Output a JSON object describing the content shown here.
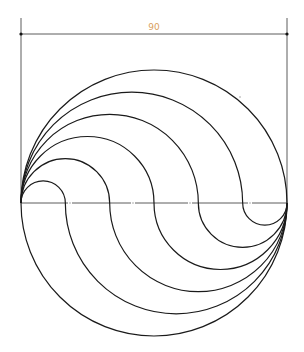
{
  "drawing": {
    "dimension": {
      "label": "90",
      "label_color": "#d9a060",
      "y": 34,
      "x1": 21,
      "x2": 286,
      "ext_top": 18
    },
    "circle": {
      "cx": 154,
      "cy": 203,
      "r": 133
    },
    "divisions": 6,
    "stroke_color": "#1a1a1a",
    "centerline": {
      "style": "dash-dot",
      "gap_positions_x": [
        70,
        133,
        190,
        250
      ]
    },
    "stray_dot": {
      "x": 240,
      "y": 97
    }
  }
}
